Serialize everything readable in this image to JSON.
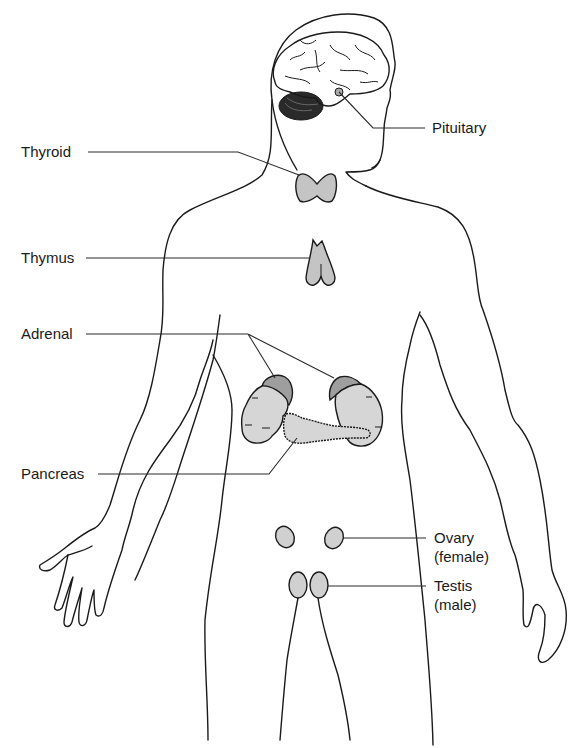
{
  "diagram": {
    "colors": {
      "outline": "#1a1a1a",
      "gland_fill": "#c4c4c4",
      "gland_fill_light": "#d6d6d6",
      "adrenal_fill": "#a8a8a8",
      "cerebellum": "#2a2a2a"
    },
    "labels": {
      "pituitary": "Pituitary",
      "thyroid": "Thyroid",
      "thymus": "Thymus",
      "adrenal": "Adrenal",
      "pancreas": "Pancreas",
      "ovary_line1": "Ovary",
      "ovary_line2": "(female)",
      "testis_line1": "Testis",
      "testis_line2": "(male)"
    }
  }
}
